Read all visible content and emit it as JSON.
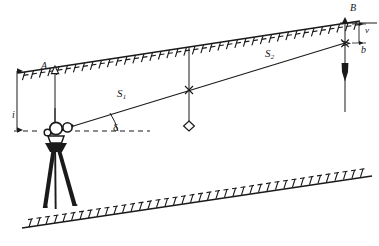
{
  "diagram": {
    "kind": "surveying-cross-section",
    "ink_color": "#1a1a1a",
    "background_color": "#ffffff",
    "labels": {
      "station_A": "A",
      "station_B": "B",
      "distance_1": "S",
      "distance_1_sub": "1",
      "distance_2": "S",
      "distance_2_sub": "2",
      "instrument_height": "i",
      "target_offset": "v",
      "target_height": "b",
      "vertical_angle": "δ"
    },
    "instruments": [
      {
        "name": "theodolite-on-tripod",
        "at": "station-left"
      },
      {
        "name": "plumb-bob",
        "at": "station-B"
      },
      {
        "name": "prism-target",
        "at": "mid-span"
      }
    ],
    "terrain": [
      {
        "name": "upper-slope-line",
        "hatch_side": "below"
      },
      {
        "name": "lower-slope-line",
        "hatch_side": "above"
      }
    ],
    "reference_lines": [
      {
        "name": "horizontal-dashed-reference",
        "style": "dashed"
      },
      {
        "name": "line-of-sight",
        "style": "solid"
      }
    ]
  }
}
